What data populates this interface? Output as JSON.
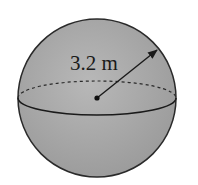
{
  "diagram": {
    "shape": "sphere",
    "radius_label": "3.2 m",
    "colors": {
      "fill": "#a9a9a9",
      "stroke": "#2a2a2a",
      "background": "#ffffff"
    }
  }
}
